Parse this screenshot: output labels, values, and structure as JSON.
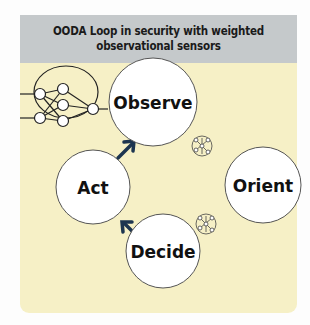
{
  "header": {
    "title_line1": "OODA Loop in security with weighted",
    "title_line2": "observational sensors"
  },
  "nodes": [
    {
      "id": "observe",
      "label": "Observe"
    },
    {
      "id": "orient",
      "label": "Orient"
    },
    {
      "id": "decide",
      "label": "Decide"
    },
    {
      "id": "act",
      "label": "Act"
    }
  ],
  "icons": [
    "neural-network-icon",
    "small-network-icon",
    "small-network-icon"
  ],
  "colors": {
    "panel": "#f6f0c6",
    "header": "#c5c9cb",
    "arrow": "#1d3550",
    "node_fill": "#ffffff"
  }
}
